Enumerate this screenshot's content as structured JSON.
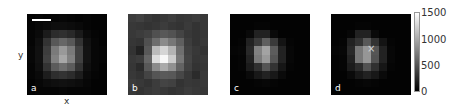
{
  "figure": {
    "axis_labels": {
      "x": "x",
      "y": "y"
    },
    "panels": [
      {
        "label": "a"
      },
      {
        "label": "b"
      },
      {
        "label": "c"
      },
      {
        "label": "d"
      }
    ],
    "marker": {
      "symbol": "×",
      "panel": "d"
    },
    "colorbar": {
      "ticks": [
        "1500",
        "1000",
        "500",
        "0"
      ],
      "min": 0,
      "max": 1500,
      "colormap": "gray"
    }
  },
  "chart_data": {
    "type": "heatmap",
    "title": "",
    "xlabel": "x",
    "ylabel": "y",
    "colormap": "gray",
    "vmin": 0,
    "vmax": 1500,
    "colorbar_ticks": [
      0,
      500,
      1000,
      1500
    ],
    "panels": [
      {
        "label": "a",
        "scale_bar": true,
        "grid": [
          [
            20,
            30,
            20,
            30,
            40,
            30,
            20,
            30,
            20,
            20
          ],
          [
            20,
            40,
            60,
            80,
            80,
            70,
            50,
            30,
            20,
            20
          ],
          [
            30,
            60,
            160,
            260,
            280,
            240,
            150,
            60,
            30,
            20
          ],
          [
            30,
            90,
            300,
            520,
            600,
            520,
            300,
            100,
            40,
            20
          ],
          [
            40,
            100,
            360,
            720,
            900,
            720,
            380,
            110,
            40,
            30
          ],
          [
            40,
            100,
            380,
            760,
            980,
            760,
            380,
            110,
            40,
            30
          ],
          [
            30,
            90,
            300,
            540,
            640,
            540,
            300,
            90,
            40,
            20
          ],
          [
            30,
            60,
            170,
            270,
            300,
            260,
            170,
            60,
            30,
            20
          ],
          [
            20,
            40,
            70,
            90,
            100,
            90,
            70,
            40,
            20,
            20
          ],
          [
            20,
            30,
            30,
            30,
            40,
            30,
            30,
            30,
            20,
            20
          ]
        ]
      },
      {
        "label": "b",
        "grid": [
          [
            350,
            380,
            330,
            300,
            330,
            360,
            320,
            330,
            350,
            330
          ],
          [
            330,
            320,
            300,
            320,
            350,
            320,
            300,
            340,
            300,
            330
          ],
          [
            330,
            350,
            380,
            470,
            520,
            480,
            400,
            330,
            300,
            320
          ],
          [
            320,
            300,
            470,
            640,
            820,
            700,
            560,
            360,
            300,
            330
          ],
          [
            300,
            200,
            520,
            1100,
            1250,
            1050,
            650,
            380,
            330,
            300
          ],
          [
            330,
            350,
            600,
            1300,
            1450,
            1200,
            700,
            400,
            320,
            330
          ],
          [
            320,
            250,
            520,
            820,
            1000,
            850,
            580,
            380,
            300,
            320
          ],
          [
            330,
            300,
            400,
            500,
            530,
            520,
            420,
            330,
            250,
            330
          ],
          [
            350,
            330,
            300,
            350,
            400,
            380,
            300,
            330,
            320,
            330
          ],
          [
            330,
            300,
            330,
            350,
            330,
            300,
            320,
            350,
            330,
            320
          ]
        ]
      },
      {
        "label": "c",
        "grid": [
          [
            20,
            20,
            20,
            20,
            20,
            20,
            20,
            20,
            20,
            20
          ],
          [
            20,
            20,
            20,
            30,
            30,
            20,
            20,
            20,
            20,
            20
          ],
          [
            20,
            20,
            50,
            200,
            200,
            60,
            20,
            20,
            20,
            20
          ],
          [
            20,
            30,
            200,
            340,
            560,
            340,
            120,
            30,
            20,
            20
          ],
          [
            30,
            40,
            240,
            760,
            960,
            540,
            200,
            40,
            20,
            20
          ],
          [
            20,
            30,
            200,
            720,
            900,
            500,
            200,
            40,
            20,
            20
          ],
          [
            20,
            30,
            160,
            280,
            500,
            300,
            130,
            30,
            20,
            20
          ],
          [
            20,
            20,
            60,
            140,
            200,
            140,
            60,
            20,
            20,
            20
          ],
          [
            20,
            20,
            20,
            30,
            40,
            30,
            20,
            20,
            20,
            20
          ],
          [
            20,
            20,
            20,
            20,
            20,
            20,
            20,
            20,
            20,
            20
          ]
        ]
      },
      {
        "label": "d",
        "marker": {
          "row": 4,
          "col": 5
        },
        "grid": [
          [
            20,
            20,
            20,
            20,
            20,
            20,
            20,
            20,
            20,
            20
          ],
          [
            20,
            20,
            20,
            30,
            30,
            20,
            20,
            20,
            20,
            20
          ],
          [
            20,
            20,
            40,
            200,
            200,
            60,
            20,
            20,
            20,
            20
          ],
          [
            20,
            30,
            200,
            300,
            520,
            300,
            120,
            30,
            20,
            20
          ],
          [
            30,
            40,
            240,
            700,
            880,
            500,
            200,
            40,
            20,
            20
          ],
          [
            20,
            30,
            200,
            700,
            880,
            480,
            200,
            40,
            20,
            20
          ],
          [
            20,
            30,
            160,
            260,
            480,
            280,
            130,
            30,
            20,
            20
          ],
          [
            20,
            20,
            60,
            140,
            200,
            140,
            60,
            20,
            20,
            20
          ],
          [
            20,
            20,
            20,
            30,
            40,
            30,
            20,
            20,
            20,
            20
          ],
          [
            20,
            20,
            20,
            20,
            20,
            20,
            20,
            20,
            20,
            20
          ]
        ]
      }
    ]
  }
}
